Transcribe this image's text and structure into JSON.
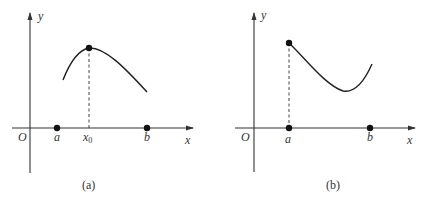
{
  "panels": [
    {
      "caption": "(a)",
      "origin_label": "O",
      "x_axis_label": "x",
      "y_axis_label": "y",
      "points": [
        {
          "label": "a"
        },
        {
          "label": "x",
          "subscript": "0"
        },
        {
          "label": "b"
        }
      ],
      "description": "Curve on [a,b] attaining its maximum at interior point x0"
    },
    {
      "caption": "(b)",
      "origin_label": "O",
      "x_axis_label": "x",
      "y_axis_label": "y",
      "points": [
        {
          "label": "a"
        },
        {
          "label": "b"
        }
      ],
      "description": "Curve on [a,b] attaining its maximum at endpoint a"
    }
  ]
}
